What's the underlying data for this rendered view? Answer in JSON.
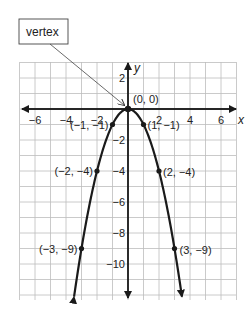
{
  "callout": {
    "label": "vertex"
  },
  "axes": {
    "x_label": "x",
    "y_label": "y",
    "x_ticks": [
      {
        "value": -6,
        "label": "−6"
      },
      {
        "value": -4,
        "label": "−4"
      },
      {
        "value": -2,
        "label": "−2"
      },
      {
        "value": 2,
        "label": "2"
      },
      {
        "value": 4,
        "label": "4"
      },
      {
        "value": 6,
        "label": "6"
      }
    ],
    "y_ticks": [
      {
        "value": 2,
        "label": "2"
      },
      {
        "value": -2,
        "label": "−2"
      },
      {
        "value": -4,
        "label": "−4"
      },
      {
        "value": -6,
        "label": "−6"
      },
      {
        "value": -8,
        "label": "−8"
      },
      {
        "value": -10,
        "label": "−10"
      }
    ]
  },
  "points": [
    {
      "x": 0,
      "y": 0,
      "label": "(0, 0)"
    },
    {
      "x": -1,
      "y": -1,
      "label": "(−1, −1)"
    },
    {
      "x": 1,
      "y": -1,
      "label": "(1, −1)"
    },
    {
      "x": -2,
      "y": -4,
      "label": "(−2, −4)"
    },
    {
      "x": 2,
      "y": -4,
      "label": "(2, −4)"
    },
    {
      "x": -3,
      "y": -9,
      "label": "(−3, −9)"
    },
    {
      "x": 3,
      "y": -9,
      "label": "(3, −9)"
    }
  ],
  "chart_data": {
    "type": "line",
    "title": "",
    "function": "y = -x^2",
    "xlabel": "x",
    "ylabel": "y",
    "xlim": [
      -7,
      7
    ],
    "ylim": [
      -12,
      3
    ],
    "grid": true,
    "x": [
      -3,
      -2,
      -1,
      0,
      1,
      2,
      3
    ],
    "series": [
      {
        "name": "y = -x^2",
        "values": [
          -9,
          -4,
          -1,
          0,
          -1,
          -4,
          -9
        ]
      }
    ],
    "x_tick_labels": [
      "-6",
      "-4",
      "-2",
      "2",
      "4",
      "6"
    ],
    "y_tick_labels": [
      "2",
      "-2",
      "-4",
      "-6",
      "-8",
      "-10"
    ],
    "annotations": [
      {
        "text": "vertex",
        "points_to": [
          0,
          0
        ]
      },
      {
        "text": "(0, 0)",
        "at": [
          0,
          0
        ]
      },
      {
        "text": "(-1, -1)",
        "at": [
          -1,
          -1
        ]
      },
      {
        "text": "(1, -1)",
        "at": [
          1,
          -1
        ]
      },
      {
        "text": "(-2, -4)",
        "at": [
          -2,
          -4
        ]
      },
      {
        "text": "(2, -4)",
        "at": [
          2,
          -4
        ]
      },
      {
        "text": "(-3, -9)",
        "at": [
          -3,
          -9
        ]
      },
      {
        "text": "(3, -9)",
        "at": [
          3,
          -9
        ]
      }
    ]
  }
}
